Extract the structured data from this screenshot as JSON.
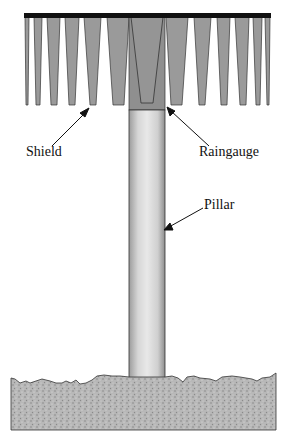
{
  "diagram": {
    "title": "",
    "labels": {
      "shield": "Shield",
      "raingauge": "Raingauge",
      "pillar": "Pillar"
    },
    "components": [
      "Shield",
      "Raingauge",
      "Pillar",
      "Ground"
    ],
    "colors": {
      "shield_slat": "#9a9a9a",
      "top_bar": "#111111",
      "raingauge": "#8f8f8f",
      "pillar_light": "#e2e2e2",
      "pillar_dark": "#a8a8a8",
      "ground": "#b4b4b4"
    }
  }
}
